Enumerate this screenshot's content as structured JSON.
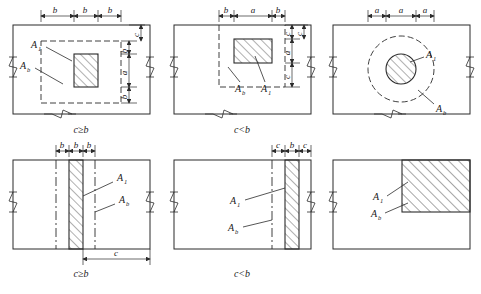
{
  "figure": {
    "stroke_color": "#2b2b2b",
    "hatch_color": "#3a3a3a",
    "panels": [
      {
        "id": "panel-1",
        "caption": "c≥b",
        "shape": "rectangle-centered",
        "label_a1": "A",
        "label_a1_sub": "1",
        "label_ab": "A",
        "label_ab_sub": "b",
        "top_dims": [
          "b",
          "b",
          "b"
        ],
        "right_dims": [
          "b",
          "a",
          "b"
        ],
        "right_outer_dim": "c"
      },
      {
        "id": "panel-2",
        "caption": "c<b",
        "shape": "rectangle-corner-clipped",
        "label_a1": "A",
        "label_a1_sub": "1",
        "label_ab": "A",
        "label_ab_sub": "b",
        "top_dims": [
          "b",
          "a",
          "b"
        ],
        "right_dims": [
          "c",
          "a",
          "c"
        ],
        "right_outer_dim": "c"
      },
      {
        "id": "panel-3",
        "caption": "",
        "shape": "circle-centered",
        "label_a1": "A",
        "label_a1_sub": "1",
        "label_ab": "A",
        "label_ab_sub": "b",
        "top_dims": [
          "a",
          "a",
          "a"
        ],
        "right_dims": [],
        "right_outer_dim": ""
      },
      {
        "id": "panel-4",
        "caption": "c≥b",
        "shape": "strip-centered",
        "label_a1": "A",
        "label_a1_sub": "1",
        "label_ab": "A",
        "label_ab_sub": "b",
        "top_dims": [
          "b",
          "b",
          "b"
        ],
        "bottom_dim": "c"
      },
      {
        "id": "panel-5",
        "caption": "c<b",
        "shape": "strip-edge",
        "label_a1": "A",
        "label_a1_sub": "1",
        "label_ab": "A",
        "label_ab_sub": "b",
        "top_dims": [
          "c",
          "b",
          "c"
        ],
        "bottom_dim": ""
      },
      {
        "id": "panel-6",
        "caption": "",
        "shape": "block-corner",
        "label_a1": "A",
        "label_a1_sub": "1",
        "label_ab": "A",
        "label_ab_sub": "b",
        "top_dims": [],
        "bottom_dim": ""
      }
    ]
  }
}
